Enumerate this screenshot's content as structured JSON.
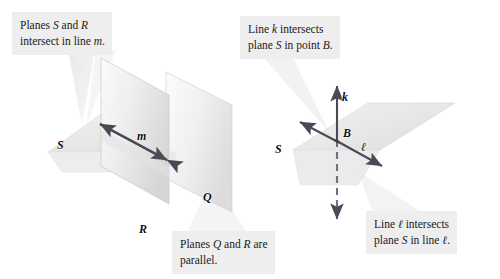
{
  "figure": {
    "background_color": "#ffffff"
  },
  "callouts": [
    {
      "id": "callout-planes-sr",
      "line1_pre": "Planes ",
      "line1_var1": "S",
      "line1_mid": " and ",
      "line1_var2": "R",
      "line2_pre": "intersect in line ",
      "line2_var": "m",
      "line2_post": ".",
      "bg": "#eeeeee"
    },
    {
      "id": "callout-line-k",
      "line1_pre": "Line ",
      "line1_var1": "k",
      "line1_mid": " intersects",
      "line1_var2": "",
      "line2_pre": "plane ",
      "line2_var": "S",
      "line2_post": " in point ",
      "line2_var2": "B",
      "line2_end": ".",
      "bg": "#eeeeee"
    },
    {
      "id": "callout-planes-qr",
      "line1_pre": "Planes ",
      "line1_var1": "Q",
      "line1_mid": " and ",
      "line1_var2": "R",
      "line1_post": " are",
      "line2_pre": "parallel.",
      "bg": "#eeeeee"
    },
    {
      "id": "callout-line-ell",
      "line1_pre": "Line ",
      "line1_var1": "ℓ",
      "line1_mid": " intersects",
      "line2_pre": "plane ",
      "line2_var": "S",
      "line2_post": " in line ",
      "line2_var2": "ℓ",
      "line2_end": ".",
      "bg": "#eeeeee"
    }
  ],
  "labels": {
    "plane_S_left": "S",
    "line_m": "m",
    "plane_Q": "Q",
    "plane_R": "R",
    "plane_S_right": "S",
    "line_k": "k",
    "point_B": "B",
    "line_ell": "ℓ"
  },
  "colors": {
    "plane_fill_light": "#f2f2f2",
    "plane_fill_mid": "#e6e6e6",
    "plane_fill_dark": "#d9d9d9",
    "plane_edge": "#cfcfcf",
    "arrow": "#4a4a57",
    "callout_bg": "#eeeeee",
    "text": "#1a1a1a"
  },
  "left_figure": {
    "description": "Three planes: horizontal plane S, vertical plane R intersecting S in line m, and a parallel vertical plane Q.",
    "planes": [
      "S",
      "R",
      "Q"
    ],
    "intersection_line": "m"
  },
  "right_figure": {
    "description": "Horizontal plane S pierced vertically by line k at point B; line l lies in plane S.",
    "planes": [
      "S"
    ],
    "lines": [
      "k",
      "ℓ"
    ],
    "point": "B"
  }
}
